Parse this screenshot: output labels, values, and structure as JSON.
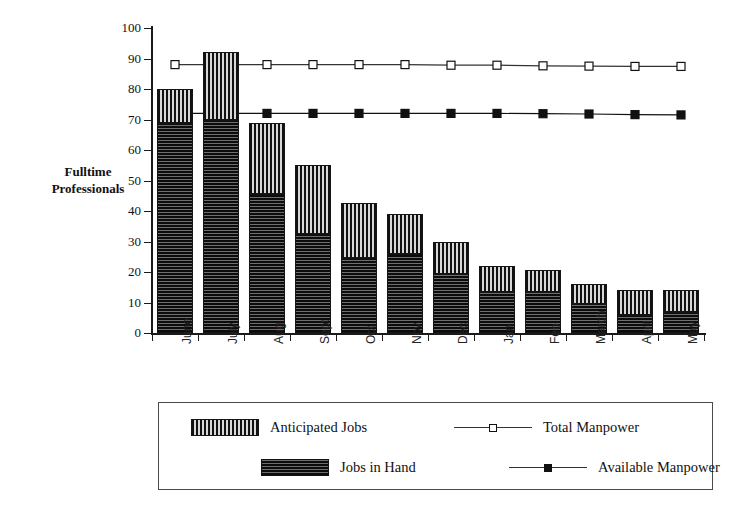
{
  "chart_data": {
    "type": "bar",
    "subtype": "stacked-bar-with-lines",
    "title": "",
    "xlabel": "",
    "ylabel": "Fulltime Professionals",
    "ylim": [
      0,
      100
    ],
    "ytick_step": 10,
    "yticks": [
      0,
      10,
      20,
      30,
      40,
      50,
      60,
      70,
      80,
      90,
      100
    ],
    "grid": false,
    "legend_position": "bottom",
    "categories": [
      "June",
      "July",
      "Aug",
      "Sept",
      "Oct",
      "Nov",
      "Dec",
      "Jan",
      "Feb",
      "March",
      "April",
      "May"
    ],
    "series": [
      {
        "name": "Jobs in Hand",
        "kind": "bar-segment",
        "stack": "jobs",
        "pattern": "horizontal-stripes",
        "color": "#3a3a3a",
        "values": [
          69,
          70,
          45.5,
          32.5,
          24.5,
          26,
          19.5,
          13.5,
          13.5,
          9.5,
          6,
          7
        ]
      },
      {
        "name": "Anticipated Jobs",
        "kind": "bar-segment",
        "stack": "jobs",
        "pattern": "vertical-stripes",
        "color": "#8d8d8d",
        "values": [
          11,
          22,
          23.5,
          22.5,
          18,
          13,
          10.5,
          8.5,
          7,
          6.5,
          8,
          7
        ]
      },
      {
        "name": "Total Manpower",
        "kind": "line",
        "marker": "open-square",
        "color": "#333333",
        "values": [
          88,
          88,
          88,
          88,
          88,
          88,
          87.8,
          87.8,
          87.6,
          87.5,
          87.4,
          87.4
        ]
      },
      {
        "name": "Available Manpower",
        "kind": "line",
        "marker": "filled-square",
        "color": "#111111",
        "values": [
          72,
          72,
          72,
          72,
          72,
          72,
          72,
          72,
          71.9,
          71.8,
          71.6,
          71.5
        ]
      }
    ],
    "bar_totals": [
      80,
      92,
      69,
      55,
      42.5,
      39,
      30,
      22,
      20.5,
      16,
      14,
      14
    ]
  },
  "axis": {
    "y_title_line1": "Fulltime",
    "y_title_line2": "Professionals"
  },
  "legend": {
    "items": [
      {
        "label": "Anticipated Jobs",
        "glyph": "vertical-stripe-swatch"
      },
      {
        "label": "Total Manpower",
        "glyph": "open-square-marker-line"
      },
      {
        "label": "Jobs in Hand",
        "glyph": "horizontal-stripe-swatch"
      },
      {
        "label": "Available Manpower",
        "glyph": "filled-square-marker-line"
      }
    ]
  }
}
